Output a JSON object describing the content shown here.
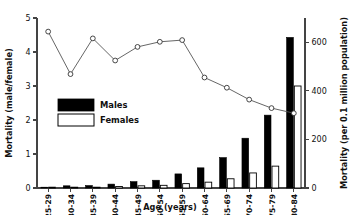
{
  "chart_data": {
    "type": "bar",
    "title": "",
    "subtitle": "",
    "xlabel": "Age (years)",
    "ylabel": "Mortality (male/female)",
    "y2label": "Mortality (per 0.1 million population)",
    "categories": [
      "25-29",
      "30-34",
      "35-39",
      "40-44",
      "45-49",
      "50-54",
      "55-59",
      "60-64",
      "65-69",
      "70-74",
      "75-79",
      "80-84"
    ],
    "ylim": [
      0,
      5
    ],
    "y2lim": [
      0,
      700
    ],
    "yticks": [
      0,
      1,
      2,
      3,
      4,
      5
    ],
    "yticklabels": [
      "0",
      "1",
      "2",
      "3",
      "4",
      "5"
    ],
    "y2ticks": [
      0,
      200,
      400,
      600
    ],
    "y2ticklabels": [
      "0",
      "200",
      "400",
      "600"
    ],
    "grid": false,
    "legend_position": "upper-left-inside",
    "series": [
      {
        "name": "Males",
        "type": "bar",
        "axis": "right",
        "color": "#000000",
        "values": [
          1,
          9,
          10,
          16,
          26,
          32,
          58,
          83,
          125,
          205,
          300,
          620
        ]
      },
      {
        "name": "Females",
        "type": "bar",
        "axis": "right",
        "color": "#ffffff",
        "values": [
          0,
          2,
          3,
          6,
          9,
          11,
          18,
          24,
          38,
          62,
          90,
          420
        ]
      },
      {
        "name": "Mortality ratio (male/female)",
        "type": "line",
        "axis": "left",
        "color": "#555555",
        "values": [
          4.6,
          3.35,
          4.4,
          3.75,
          4.15,
          4.3,
          4.35,
          3.25,
          2.95,
          2.6,
          2.35,
          2.2
        ]
      }
    ]
  },
  "legend": {
    "items": [
      {
        "label": "Males",
        "swatch": "filled-black"
      },
      {
        "label": "Females",
        "swatch": "outlined-white"
      }
    ]
  }
}
